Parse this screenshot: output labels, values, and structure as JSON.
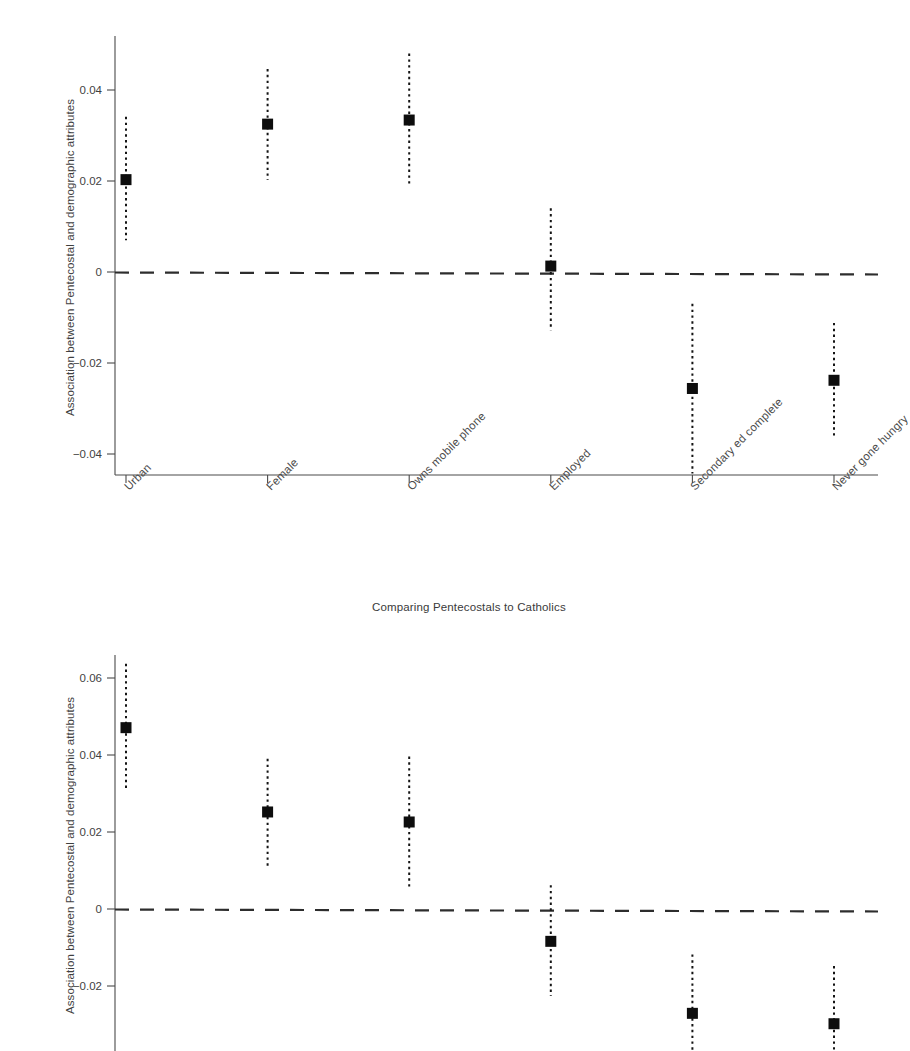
{
  "figure": {
    "background_color": "#ffffff",
    "marker_color": "#0d0d0d",
    "axis_color": "#4a4a4a",
    "zero_line_color": "#2d2d2d"
  },
  "panels": [
    {
      "id": "top",
      "caption": "Comparing Pentecostals to Catholics",
      "ylabel": "Association between Pentecostal and demographic attributes",
      "ytick_labels": [
        "0.04",
        "0.02",
        "0",
        "-0.02",
        "-0.04"
      ]
    },
    {
      "id": "bottom",
      "caption": "",
      "ylabel": "Association between Pentecostal and demographic attributes",
      "ytick_labels": [
        "0.06",
        "0.04",
        "0.02",
        "0",
        "-0.02"
      ]
    }
  ],
  "chart_data": [
    {
      "type": "scatter",
      "title": "Comparing Pentecostals to Catholics",
      "xlabel": "",
      "ylabel": "Association between Pentecostal and demographic attributes",
      "categories": [
        "Urban",
        "Female",
        "Owns mobile phone",
        "Employed",
        "Secondary ed complete",
        "Never gone hungry"
      ],
      "values": [
        0.0203,
        0.0325,
        0.0334,
        0.0013,
        -0.0256,
        -0.0238
      ],
      "ci_low": [
        0.007,
        0.0202,
        0.0188,
        -0.0128,
        -0.0443,
        -0.0363
      ],
      "ci_high": [
        0.0341,
        0.0446,
        0.048,
        0.014,
        -0.007,
        -0.0112
      ],
      "yticks": [
        0.04,
        0.02,
        0,
        -0.02,
        -0.04
      ],
      "ytick_labels": [
        "0.04",
        "0.02",
        "0",
        "-0.02",
        "-0.04"
      ],
      "ylim": [
        -0.0455,
        0.0482
      ],
      "reference_line": 0,
      "reference_line_style": "dashed",
      "grid": false,
      "legend": "none",
      "error_bar_style": "dotted"
    },
    {
      "type": "scatter",
      "title": "",
      "xlabel": "",
      "ylabel": "Association between Pentecostal and demographic attributes",
      "categories": [
        "Urban",
        "Female",
        "Owns mobile phone",
        "Employed",
        "Secondary ed complete",
        "Never gone hungry"
      ],
      "values": [
        0.0471,
        0.0252,
        0.0226,
        -0.0084,
        -0.0271,
        -0.0298
      ],
      "ci_low": [
        0.0312,
        0.0111,
        0.0056,
        -0.0226,
        -0.0415,
        -0.044
      ],
      "ci_high": [
        0.0637,
        0.039,
        0.0396,
        0.0062,
        -0.0118,
        -0.0148
      ],
      "yticks": [
        0.06,
        0.04,
        0.02,
        0,
        -0.02
      ],
      "ytick_labels": [
        "0.06",
        "0.04",
        "0.02",
        "0",
        "-0.02"
      ],
      "ylim": [
        -0.045,
        0.0668
      ],
      "reference_line": 0,
      "reference_line_style": "dashed",
      "grid": false,
      "legend": "none",
      "error_bar_style": "dotted",
      "clipped_bottom": true
    }
  ]
}
